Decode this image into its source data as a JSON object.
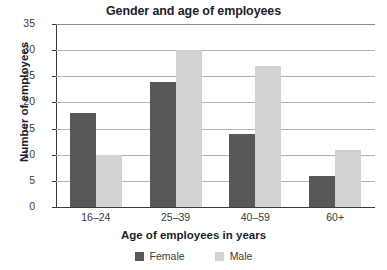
{
  "chart_data": {
    "type": "bar",
    "title": "Gender and age of employees",
    "xlabel": "Age of employees in years",
    "ylabel": "Number of employees",
    "categories": [
      "16–24",
      "25–39",
      "40–59",
      "60+"
    ],
    "series": [
      {
        "name": "Female",
        "color": "#58585a",
        "values": [
          18,
          24,
          14,
          6
        ]
      },
      {
        "name": "Male",
        "color": "#d2d2d2",
        "values": [
          10,
          30,
          27,
          11
        ]
      }
    ],
    "ylim": [
      0,
      35
    ],
    "ytick_step": 5,
    "yticks": [
      0,
      5,
      10,
      15,
      20,
      25,
      30,
      35
    ],
    "ytick_labels": [
      "0",
      "5",
      "10",
      "15",
      "20",
      "25",
      "30",
      "35"
    ],
    "grid": true,
    "grid_axis": "y",
    "legend_position": "bottom-center",
    "bar_group_style": "clustered"
  }
}
